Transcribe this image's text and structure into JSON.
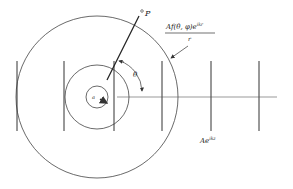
{
  "diagram": {
    "labels": {
      "point": "P",
      "scattered_wave_numerator": "Af(θ, φ)e",
      "scattered_wave_exponent": "ikr",
      "scattered_wave_denominator": "r",
      "angle": "θ",
      "radius": "a",
      "incident_wave_base": "Ae",
      "incident_wave_exponent": "ikz"
    },
    "colors": {
      "stroke": "#333333",
      "background": "#ffffff"
    },
    "geometry": {
      "center": [
        97,
        97
      ],
      "circle_radii": [
        11,
        32,
        81
      ],
      "wavefront_x": [
        17,
        64,
        114,
        162,
        211,
        259
      ],
      "wavefront_y_range": [
        61,
        131
      ],
      "axis_x_range": [
        117,
        277
      ]
    }
  }
}
